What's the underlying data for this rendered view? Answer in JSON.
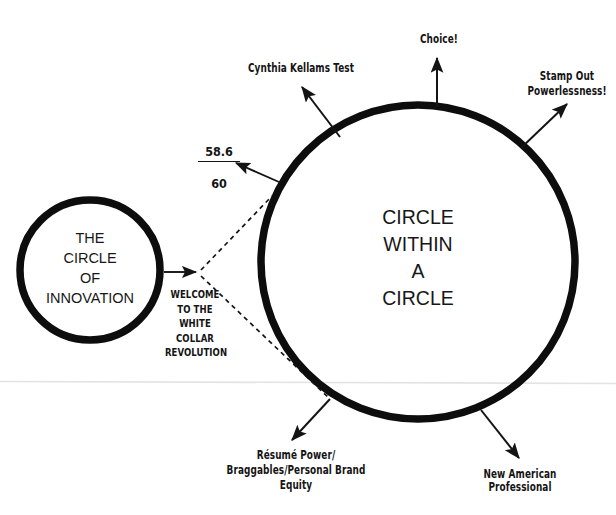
{
  "page": {
    "title": "Circle Within a Circle",
    "background_color": "#ffffff",
    "ink_color": "#111111"
  },
  "circles": {
    "inner": {
      "name": "the-circle-of-innovation",
      "text": "THE\nCIRCLE\nOF\nINNOVATION",
      "cx": 90,
      "cy": 270,
      "r": 70,
      "stroke_width": 7
    },
    "outer": {
      "name": "circle-within-a-circle",
      "text": "CIRCLE\nWITHIN\nA\nCIRCLE",
      "cx": 418,
      "cy": 262,
      "r": 157,
      "stroke_width": 7
    }
  },
  "connector": {
    "transition_label": "WELCOME\nTO THE\nWHITE\nCOLLAR\nREVOLUTION",
    "ratio": {
      "numerator": "58.6",
      "denominator": "60"
    }
  },
  "annotations": [
    {
      "id": "cynthia",
      "text": "Cynthia Kellams Test"
    },
    {
      "id": "choice",
      "text": "Choice!"
    },
    {
      "id": "stamp",
      "text": "Stamp Out\nPowerlessness!"
    },
    {
      "id": "resume",
      "text": "Résumé Power/\nBraggables/Personal Brand Equity"
    },
    {
      "id": "newamerican",
      "text": "New American Professional"
    }
  ]
}
